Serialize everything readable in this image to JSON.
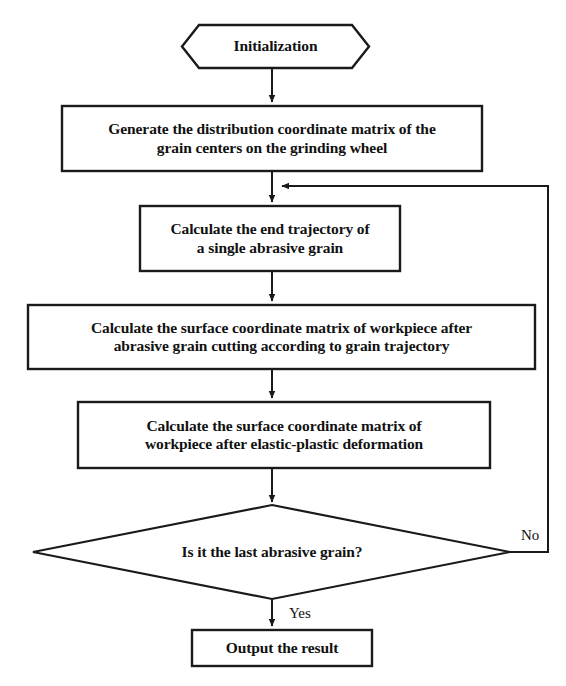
{
  "diagram": {
    "type": "flowchart",
    "width": 566,
    "height": 686,
    "stroke_color": "#1a1a1a",
    "fill_color": "#ffffff",
    "text_color": "#111111"
  },
  "nodes": {
    "start": {
      "shape": "hexagon",
      "label": "Initialization"
    },
    "step1": {
      "shape": "rectangle",
      "label": "Generate the distribution coordinate matrix of the\ngrain centers on the grinding wheel"
    },
    "step2": {
      "shape": "rectangle",
      "label": "Calculate the end trajectory of\na single abrasive grain"
    },
    "step3": {
      "shape": "rectangle",
      "label": "Calculate the surface coordinate matrix of workpiece after\nabrasive grain cutting according to grain trajectory"
    },
    "step4": {
      "shape": "rectangle",
      "label": "Calculate the surface coordinate matrix of\nworkpiece after elastic-plastic deformation"
    },
    "decision": {
      "shape": "diamond",
      "label": "Is it the last abrasive grain?"
    },
    "end": {
      "shape": "rectangle",
      "label": "Output the result"
    }
  },
  "edges": {
    "start_to_step1": {
      "label": ""
    },
    "step1_to_step2": {
      "label": ""
    },
    "step2_to_step3": {
      "label": ""
    },
    "step3_to_step4": {
      "label": ""
    },
    "step4_to_decision": {
      "label": ""
    },
    "decision_no_loop": {
      "label": "No"
    },
    "decision_yes": {
      "label": "Yes"
    }
  }
}
